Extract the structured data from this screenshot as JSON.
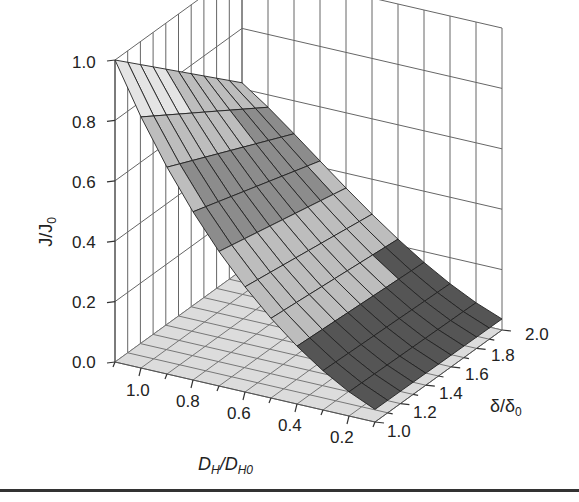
{
  "chart_data": {
    "type": "surface3d",
    "title": "",
    "zlabel": "J/J0",
    "xlabel": "DH/DH0",
    "ylabel": "δ/δ0",
    "z_ticks": [
      "0.0",
      "0.2",
      "0.4",
      "0.6",
      "0.8",
      "1.0"
    ],
    "x_ticks": [
      "1.0",
      "0.8",
      "0.6",
      "0.4",
      "0.2"
    ],
    "y_ticks": [
      "1.0",
      "1.2",
      "1.4",
      "1.6",
      "1.8",
      "2.0"
    ],
    "xlim": [
      0.1,
      1.1
    ],
    "ylim": [
      1.0,
      2.0
    ],
    "zlim": [
      0.0,
      1.0
    ],
    "grid": true,
    "x": [
      1.1,
      1.0,
      0.9,
      0.8,
      0.7,
      0.6,
      0.5,
      0.4,
      0.3,
      0.2,
      0.1
    ],
    "y": [
      1.0,
      1.1,
      1.2,
      1.3,
      1.4,
      1.5,
      1.6,
      1.7,
      1.8,
      1.9,
      2.0
    ],
    "z_description": "J/J0 peaks at 1.0 near DH/DH0=1.1, δ/δ0=1.0 and decays toward ~0 at low DH/DH0; decreases with increasing δ/δ0",
    "z_sample": {
      "at_delta_1.0": [
        1.0,
        0.72,
        0.55,
        0.42,
        0.31,
        0.22,
        0.15,
        0.09,
        0.05,
        0.02,
        0.01
      ],
      "at_delta_2.0": [
        0.62,
        0.55,
        0.46,
        0.37,
        0.28,
        0.2,
        0.13,
        0.08,
        0.04,
        0.02,
        0.01
      ]
    },
    "colors": {
      "floor": "#dcdcdc",
      "surface_light": "#bdbdbd",
      "surface_mid": "#8c8c8c",
      "surface_dark": "#555555",
      "gridline": "#555555"
    }
  },
  "labels": {
    "zlabel_main": "J/J",
    "zlabel_sub": "0",
    "xlabel_main1": "D",
    "xlabel_sub1": "H",
    "xlabel_slash": "/D",
    "xlabel_sub2": "H0",
    "ylabel_main1": "δ/δ",
    "ylabel_sub": "0"
  }
}
